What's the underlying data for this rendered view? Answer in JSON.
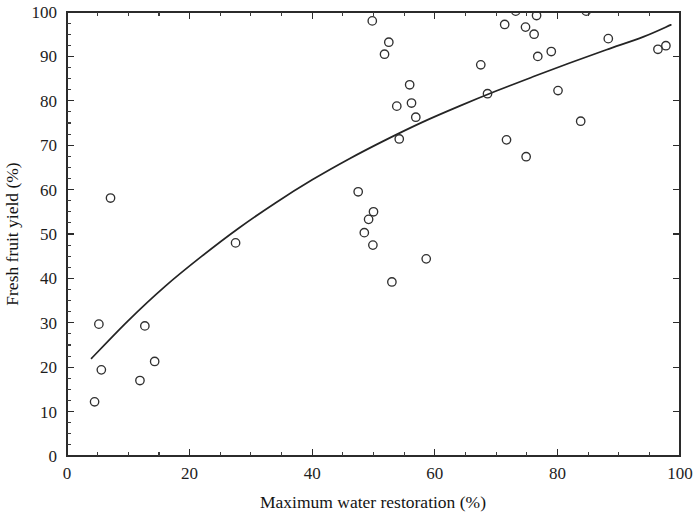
{
  "figure": {
    "background_color": "#ffffff",
    "ink_color": "#242424",
    "marker_color": "#303030"
  },
  "axes": {
    "x_title": "Maximum water restoration (%)",
    "y_title": "Fresh fruit yield (%)",
    "x_ticks": [
      "0",
      "20",
      "40",
      "60",
      "80",
      "100"
    ],
    "y_ticks": [
      "0",
      "10",
      "20",
      "30",
      "40",
      "50",
      "60",
      "70",
      "80",
      "90",
      "100"
    ]
  },
  "chart_data": {
    "type": "scatter",
    "title": "",
    "xlabel": "Maximum water restoration (%)",
    "ylabel": "Fresh fruit yield (%)",
    "xlim": [
      0,
      100
    ],
    "ylim": [
      0,
      100
    ],
    "xticks": [
      0,
      20,
      40,
      60,
      80,
      100
    ],
    "yticks": [
      0,
      10,
      20,
      30,
      40,
      50,
      60,
      70,
      80,
      90,
      100
    ],
    "x_minor_tick_step": 5,
    "y_minor_tick_step": 2.5,
    "grid": false,
    "legend": null,
    "marker": "open-circle",
    "series": [
      {
        "name": "observations",
        "points": [
          [
            4.5,
            12.2
          ],
          [
            5.2,
            29.7
          ],
          [
            5.6,
            19.4
          ],
          [
            7.1,
            58.1
          ],
          [
            11.9,
            17.0
          ],
          [
            12.7,
            29.3
          ],
          [
            14.3,
            21.3
          ],
          [
            27.5,
            48.0
          ],
          [
            47.5,
            59.5
          ],
          [
            48.5,
            50.3
          ],
          [
            49.2,
            53.3
          ],
          [
            49.8,
            98.0
          ],
          [
            49.9,
            47.5
          ],
          [
            50.0,
            55.0
          ],
          [
            51.8,
            90.5
          ],
          [
            52.5,
            93.2
          ],
          [
            53.0,
            39.2
          ],
          [
            53.8,
            78.8
          ],
          [
            54.2,
            71.4
          ],
          [
            55.9,
            83.6
          ],
          [
            56.2,
            79.5
          ],
          [
            56.9,
            76.3
          ],
          [
            58.6,
            44.4
          ],
          [
            67.5,
            88.1
          ],
          [
            68.6,
            81.6
          ],
          [
            71.4,
            97.2
          ],
          [
            71.7,
            71.2
          ],
          [
            73.2,
            100.2
          ],
          [
            74.8,
            96.6
          ],
          [
            74.9,
            67.4
          ],
          [
            76.2,
            95.0
          ],
          [
            76.6,
            99.2
          ],
          [
            76.8,
            90.0
          ],
          [
            79.0,
            91.1
          ],
          [
            80.1,
            82.3
          ],
          [
            83.8,
            75.4
          ],
          [
            84.7,
            100.2
          ],
          [
            88.3,
            94.0
          ],
          [
            96.4,
            91.6
          ],
          [
            97.7,
            92.4
          ]
        ]
      }
    ],
    "fit_curve": {
      "name": "fitted trend",
      "style": "solid-line",
      "points": [
        [
          4.0,
          22.0
        ],
        [
          10.0,
          30.5
        ],
        [
          16.0,
          38.2
        ],
        [
          22.0,
          45.0
        ],
        [
          28.0,
          51.3
        ],
        [
          34.0,
          57.0
        ],
        [
          40.0,
          62.2
        ],
        [
          46.0,
          66.9
        ],
        [
          52.0,
          71.2
        ],
        [
          58.0,
          75.2
        ],
        [
          64.0,
          78.8
        ],
        [
          70.0,
          82.2
        ],
        [
          76.0,
          85.4
        ],
        [
          82.0,
          88.5
        ],
        [
          88.0,
          91.5
        ],
        [
          94.0,
          94.4
        ],
        [
          98.5,
          97.1
        ]
      ]
    }
  }
}
